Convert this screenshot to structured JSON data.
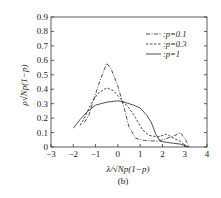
{
  "chart_data": {
    "type": "line",
    "title": "",
    "caption": "(b)",
    "xlabel": "λ/√Np(1−p)",
    "ylabel": "ρ√Np(1−p)",
    "xlim": [
      -3,
      4
    ],
    "ylim": [
      0,
      0.9
    ],
    "xticks": [
      -3,
      -2,
      -1,
      0,
      1,
      2,
      3,
      4
    ],
    "xtick_labels": [
      "−3",
      "−2",
      "−1",
      "0",
      "1",
      "2",
      "3",
      "4"
    ],
    "yticks": [
      0,
      0.1,
      0.2,
      0.3,
      0.4,
      0.5,
      0.6,
      0.7,
      0.8,
      0.9
    ],
    "ytick_labels": [
      "0",
      "0.1",
      "0.2",
      "0.3",
      "0.4",
      "0.5",
      "0.6",
      "0.7",
      "0.8",
      "0.9"
    ],
    "grid": false,
    "legend_position": "top-right",
    "series": [
      {
        "name": ":p=0.1",
        "style": "dash-dot",
        "points": [
          [
            -1.5,
            0.17
          ],
          [
            -1.3,
            0.22
          ],
          [
            -1.1,
            0.32
          ],
          [
            -0.8,
            0.46
          ],
          [
            -0.5,
            0.58
          ],
          [
            -0.3,
            0.54
          ],
          [
            0,
            0.42
          ],
          [
            0.3,
            0.26
          ],
          [
            0.5,
            0.14
          ],
          [
            0.8,
            0.06
          ],
          [
            1.2,
            0.045
          ],
          [
            1.8,
            0.04
          ],
          [
            2.2,
            0.06
          ],
          [
            2.5,
            0.075
          ],
          [
            2.8,
            0.1
          ],
          [
            3.0,
            0.06
          ],
          [
            3.2,
            0.0
          ]
        ]
      },
      {
        "name": ":p=0.3",
        "style": "dashed",
        "points": [
          [
            -1.7,
            0.15
          ],
          [
            -1.5,
            0.2
          ],
          [
            -1.2,
            0.3
          ],
          [
            -0.9,
            0.37
          ],
          [
            -0.5,
            0.41
          ],
          [
            -0.2,
            0.39
          ],
          [
            0.2,
            0.32
          ],
          [
            0.5,
            0.27
          ],
          [
            0.8,
            0.2
          ],
          [
            1.1,
            0.12
          ],
          [
            1.4,
            0.08
          ],
          [
            1.8,
            0.07
          ],
          [
            2.2,
            0.09
          ],
          [
            2.5,
            0.06
          ],
          [
            2.8,
            0.04
          ],
          [
            3.1,
            0.0
          ]
        ]
      },
      {
        "name": ":p=1",
        "style": "solid",
        "points": [
          [
            -2.0,
            0.13
          ],
          [
            -1.7,
            0.19
          ],
          [
            -1.4,
            0.24
          ],
          [
            -1.0,
            0.29
          ],
          [
            -0.5,
            0.31
          ],
          [
            0.0,
            0.32
          ],
          [
            0.3,
            0.31
          ],
          [
            0.7,
            0.29
          ],
          [
            1.0,
            0.27
          ],
          [
            1.3,
            0.22
          ],
          [
            1.5,
            0.17
          ],
          [
            1.7,
            0.09
          ],
          [
            1.9,
            0.04
          ],
          [
            2.3,
            0.03
          ],
          [
            2.8,
            0.02
          ],
          [
            3.2,
            0.0
          ]
        ]
      }
    ]
  }
}
